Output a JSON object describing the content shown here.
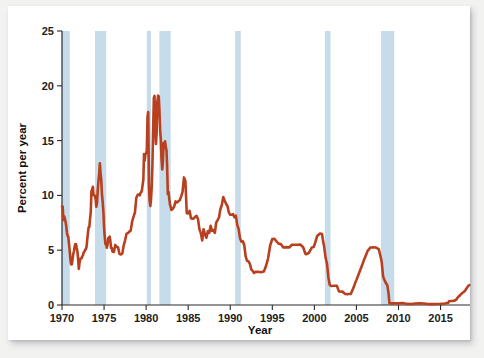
{
  "chart_data": {
    "type": "line",
    "title": "",
    "xlabel": "Year",
    "ylabel": "Percent per year",
    "xlim": [
      1970,
      2018.5
    ],
    "ylim": [
      0,
      25
    ],
    "grid": false,
    "legend": "none",
    "line_color": "#b8401f",
    "shade_color": "#c6dcea",
    "x_ticks": [
      1970,
      1975,
      1980,
      1985,
      1990,
      1995,
      2000,
      2005,
      2010,
      2015
    ],
    "y_ticks": [
      0,
      5,
      10,
      15,
      20,
      25
    ],
    "x_tick_labels": [
      "1970",
      "1975",
      "1980",
      "1985",
      "1990",
      "1995",
      "2000",
      "2005",
      "2010",
      "2015"
    ],
    "y_tick_labels": [
      "0",
      "5",
      "10",
      "15",
      "20",
      "25"
    ],
    "annotations": [
      {
        "name": "recession-shading",
        "label": "Shaded bands mark recessions"
      }
    ],
    "shaded_regions": [
      {
        "x0": 1969.92,
        "x1": 1970.92
      },
      {
        "x0": 1973.92,
        "x1": 1975.25
      },
      {
        "x0": 1980.08,
        "x1": 1980.58
      },
      {
        "x0": 1981.58,
        "x1": 1982.92
      },
      {
        "x0": 1990.58,
        "x1": 1991.25
      },
      {
        "x0": 2001.25,
        "x1": 2001.92
      },
      {
        "x0": 2007.92,
        "x1": 2009.5
      }
    ],
    "series": [
      {
        "name": "Federal funds rate",
        "x": [
          1970.0,
          1970.08,
          1970.17,
          1970.25,
          1970.33,
          1970.42,
          1970.5,
          1970.58,
          1970.67,
          1970.75,
          1970.83,
          1970.92,
          1971.0,
          1971.08,
          1971.17,
          1971.25,
          1971.33,
          1971.42,
          1971.5,
          1971.58,
          1971.67,
          1971.75,
          1971.83,
          1971.92,
          1972.0,
          1972.08,
          1972.17,
          1972.25,
          1972.33,
          1972.42,
          1972.5,
          1972.58,
          1972.67,
          1972.75,
          1972.83,
          1972.92,
          1973.0,
          1973.08,
          1973.17,
          1973.25,
          1973.33,
          1973.42,
          1973.5,
          1973.58,
          1973.67,
          1973.75,
          1973.83,
          1973.92,
          1974.0,
          1974.08,
          1974.17,
          1974.25,
          1974.33,
          1974.42,
          1974.5,
          1974.58,
          1974.67,
          1974.75,
          1974.83,
          1974.92,
          1975.0,
          1975.08,
          1975.17,
          1975.25,
          1975.33,
          1975.42,
          1975.5,
          1975.58,
          1975.67,
          1975.75,
          1975.83,
          1975.92,
          1976.0,
          1976.17,
          1976.33,
          1976.5,
          1976.67,
          1976.83,
          1977.0,
          1977.17,
          1977.33,
          1977.5,
          1977.67,
          1977.83,
          1978.0,
          1978.17,
          1978.33,
          1978.5,
          1978.67,
          1978.83,
          1979.0,
          1979.08,
          1979.17,
          1979.25,
          1979.33,
          1979.42,
          1979.5,
          1979.58,
          1979.67,
          1979.75,
          1979.83,
          1979.92,
          1980.0,
          1980.08,
          1980.17,
          1980.25,
          1980.33,
          1980.42,
          1980.5,
          1980.58,
          1980.67,
          1980.75,
          1980.83,
          1980.92,
          1981.0,
          1981.08,
          1981.17,
          1981.25,
          1981.33,
          1981.42,
          1981.5,
          1981.58,
          1981.67,
          1981.75,
          1981.83,
          1981.92,
          1982.0,
          1982.08,
          1982.17,
          1982.25,
          1982.33,
          1982.42,
          1982.5,
          1982.58,
          1982.67,
          1982.75,
          1982.83,
          1982.92,
          1983.0,
          1983.17,
          1983.33,
          1983.5,
          1983.67,
          1983.83,
          1984.0,
          1984.17,
          1984.33,
          1984.5,
          1984.67,
          1984.83,
          1985.0,
          1985.17,
          1985.33,
          1985.5,
          1985.67,
          1985.83,
          1986.0,
          1986.17,
          1986.33,
          1986.5,
          1986.67,
          1986.83,
          1987.0,
          1987.17,
          1987.33,
          1987.5,
          1987.67,
          1987.83,
          1988.0,
          1988.17,
          1988.33,
          1988.5,
          1988.67,
          1988.83,
          1989.0,
          1989.17,
          1989.33,
          1989.5,
          1989.67,
          1989.83,
          1990.0,
          1990.17,
          1990.33,
          1990.5,
          1990.67,
          1990.83,
          1991.0,
          1991.17,
          1991.33,
          1991.5,
          1991.67,
          1991.83,
          1992.0,
          1992.17,
          1992.33,
          1992.5,
          1992.67,
          1992.83,
          1993.0,
          1993.33,
          1993.67,
          1994.0,
          1994.25,
          1994.5,
          1994.75,
          1995.0,
          1995.25,
          1995.5,
          1995.75,
          1996.0,
          1996.33,
          1996.67,
          1997.0,
          1997.33,
          1997.67,
          1998.0,
          1998.33,
          1998.67,
          1998.92,
          1999.0,
          1999.33,
          1999.67,
          1999.92,
          2000.0,
          2000.33,
          2000.67,
          2000.92,
          2001.0,
          2001.17,
          2001.33,
          2001.5,
          2001.67,
          2001.83,
          2002.0,
          2002.33,
          2002.67,
          2002.92,
          2003.0,
          2003.33,
          2003.67,
          2003.92,
          2004.0,
          2004.33,
          2004.67,
          2004.92,
          2005.0,
          2005.33,
          2005.67,
          2005.92,
          2006.0,
          2006.33,
          2006.67,
          2006.92,
          2007.0,
          2007.33,
          2007.67,
          2007.92,
          2008.0,
          2008.17,
          2008.33,
          2008.5,
          2008.67,
          2008.83,
          2008.92,
          2009.0,
          2009.5,
          2010.0,
          2010.5,
          2011.0,
          2011.5,
          2012.0,
          2012.5,
          2013.0,
          2013.5,
          2014.0,
          2014.5,
          2015.0,
          2015.5,
          2015.92,
          2016.0,
          2016.33,
          2016.67,
          2016.92,
          2017.0,
          2017.33,
          2017.67,
          2017.92,
          2018.0,
          2018.25,
          2018.42
        ],
        "y": [
          8.98,
          8.98,
          7.76,
          8.1,
          7.94,
          7.6,
          7.21,
          6.62,
          6.29,
          6.2,
          5.6,
          4.9,
          4.14,
          3.72,
          3.71,
          4.15,
          4.63,
          4.91,
          5.31,
          5.57,
          5.55,
          5.2,
          4.91,
          4.14,
          3.29,
          3.83,
          4.17,
          4.27,
          4.27,
          4.46,
          4.55,
          4.8,
          4.87,
          5.04,
          5.06,
          5.33,
          5.94,
          6.58,
          7.09,
          7.12,
          7.84,
          8.49,
          10.4,
          10.5,
          10.78,
          10.01,
          10.03,
          9.95,
          9.65,
          8.97,
          9.35,
          10.51,
          11.31,
          11.93,
          12.92,
          12.01,
          11.34,
          10.06,
          9.45,
          8.53,
          7.13,
          6.24,
          5.54,
          5.49,
          5.22,
          5.55,
          6.1,
          6.14,
          6.24,
          5.82,
          5.22,
          5.2,
          4.87,
          4.84,
          5.48,
          5.31,
          5.25,
          4.65,
          4.61,
          4.69,
          5.42,
          5.9,
          6.51,
          6.56,
          6.7,
          6.79,
          7.6,
          8.04,
          8.45,
          9.76,
          10.07,
          10.06,
          10.09,
          10.01,
          10.24,
          10.29,
          10.47,
          10.94,
          11.43,
          13.77,
          13.18,
          13.78,
          13.82,
          14.13,
          17.19,
          17.61,
          10.98,
          9.47,
          9.03,
          9.61,
          10.87,
          12.81,
          15.85,
          18.9,
          19.08,
          15.93,
          14.7,
          15.72,
          18.52,
          19.1,
          19.04,
          17.82,
          15.87,
          15.08,
          13.31,
          12.37,
          13.22,
          14.78,
          14.68,
          14.94,
          14.45,
          14.15,
          12.59,
          10.12,
          10.31,
          9.71,
          9.2,
          8.95,
          8.68,
          8.77,
          8.98,
          9.45,
          9.35,
          9.47,
          9.56,
          9.91,
          10.32,
          11.64,
          11.3,
          8.38,
          8.35,
          8.58,
          7.92,
          7.88,
          7.9,
          8.05,
          8.14,
          7.83,
          6.92,
          6.56,
          5.89,
          6.91,
          6.43,
          6.13,
          6.73,
          6.58,
          7.22,
          6.77,
          6.83,
          6.58,
          7.51,
          7.75,
          8.01,
          8.76,
          9.12,
          9.85,
          9.53,
          9.24,
          9.02,
          8.45,
          8.23,
          8.24,
          8.29,
          8.0,
          8.15,
          7.31,
          6.91,
          6.06,
          5.78,
          5.82,
          5.45,
          4.43,
          4.03,
          3.98,
          3.76,
          3.25,
          3.1,
          2.92,
          3.02,
          3.04,
          2.99,
          3.05,
          3.56,
          4.26,
          5.45,
          6.02,
          6.05,
          5.8,
          5.6,
          5.56,
          5.24,
          5.28,
          5.25,
          5.5,
          5.5,
          5.5,
          5.52,
          5.27,
          4.68,
          4.63,
          4.74,
          5.22,
          5.3,
          5.45,
          6.29,
          6.52,
          6.47,
          5.98,
          5.31,
          4.33,
          3.77,
          2.49,
          1.82,
          1.73,
          1.75,
          1.75,
          1.24,
          1.24,
          1.22,
          1.01,
          0.98,
          1.0,
          1.01,
          1.61,
          2.16,
          2.28,
          2.94,
          3.62,
          4.16,
          4.29,
          4.94,
          5.25,
          5.24,
          5.26,
          5.25,
          5.07,
          4.24,
          3.94,
          2.61,
          2.28,
          2.0,
          1.81,
          0.97,
          0.16,
          0.15,
          0.16,
          0.15,
          0.19,
          0.1,
          0.09,
          0.14,
          0.16,
          0.14,
          0.09,
          0.08,
          0.09,
          0.11,
          0.14,
          0.2,
          0.34,
          0.37,
          0.4,
          0.54,
          0.65,
          0.91,
          1.15,
          1.3,
          1.42,
          1.7,
          1.82
        ]
      }
    ]
  },
  "axes": {
    "y_label": "Percent per year",
    "x_label": "Year"
  }
}
